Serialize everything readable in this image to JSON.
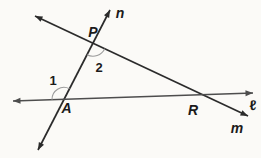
{
  "figure": {
    "type": "geometry-diagram",
    "canvas": {
      "width": 261,
      "height": 158,
      "background": "#fbfaf7"
    },
    "colors": {
      "line": "#2b2b2b",
      "line_l": "#4d4d4d",
      "arc": "#9b9b9b",
      "text": "#1b1b1b"
    },
    "lines": [
      {
        "id": "line-n",
        "label": "n",
        "from": [
          38,
          150
        ],
        "to": [
          110,
          10
        ],
        "stroke": "#2b2b2b",
        "width": 1.7,
        "label_pos": [
          120,
          18
        ],
        "label_italic": true,
        "label_size": 14
      },
      {
        "id": "line-m",
        "label": "m",
        "from": [
          35,
          16
        ],
        "to": [
          248,
          116
        ],
        "stroke": "#2b2b2b",
        "width": 1.7,
        "label_pos": [
          237,
          133
        ],
        "label_italic": true,
        "label_size": 14
      },
      {
        "id": "line-l",
        "label": "ℓ",
        "from": [
          13,
          101
        ],
        "to": [
          253,
          93
        ],
        "stroke": "#4d4d4d",
        "width": 1.4,
        "label_pos": [
          253,
          110
        ],
        "label_italic": false,
        "label_size": 14
      }
    ],
    "points": [
      {
        "id": "point-P",
        "label": "P",
        "at": [
          93,
          43.2
        ],
        "label_pos": [
          93,
          37
        ],
        "label_size": 14
      },
      {
        "id": "point-A",
        "label": "A",
        "at": [
          64,
          99.4
        ],
        "label_pos": [
          66.5,
          113
        ],
        "label_size": 14
      },
      {
        "id": "point-R",
        "label": "R",
        "at": [
          202,
          94.5
        ],
        "label_pos": [
          193,
          115
        ],
        "label_size": 14
      }
    ],
    "angle_marks": [
      {
        "id": "angle-1",
        "label": "1",
        "center": [
          64,
          99.4
        ],
        "radius": 12,
        "toward_a": [
          13,
          101
        ],
        "toward_b": [
          110,
          10
        ],
        "sweep": 1,
        "label_pos": [
          53,
          85
        ],
        "label_size": 13
      },
      {
        "id": "angle-2",
        "label": "2",
        "center": [
          93,
          43.2
        ],
        "radius": 13,
        "toward_a": [
          64,
          99.4
        ],
        "toward_b": [
          202,
          94.5
        ],
        "sweep": 0,
        "label_pos": [
          99,
          71.5
        ],
        "label_size": 13
      }
    ],
    "arrow": {
      "length": 7.5,
      "half_width": 2.9
    }
  }
}
